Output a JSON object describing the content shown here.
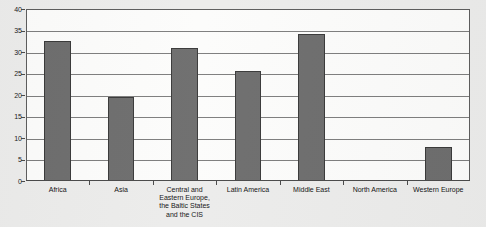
{
  "page": {
    "clipped_top_text": "· · ·",
    "background_color": "#ececeb"
  },
  "chart_data": {
    "type": "bar",
    "title": "",
    "xlabel": "",
    "ylabel": "",
    "categories": [
      "Africa",
      "Asia",
      "Central and Eastern Europe, the Baltic States and the CIS",
      "Latin America",
      "Middle East",
      "North America",
      "Western Europe"
    ],
    "values": [
      32.5,
      19.5,
      31.0,
      25.5,
      34.3,
      0,
      8.0
    ],
    "ylim": [
      0,
      40
    ],
    "yticks": [
      0,
      5,
      10,
      15,
      20,
      25,
      30,
      35,
      40
    ],
    "ytick_labels": [
      "0",
      "5",
      "10",
      "15",
      "20",
      "25",
      "30",
      "35",
      "40"
    ],
    "grid": true,
    "legend": false,
    "bar_color": "#6e6e6e",
    "bar_border_color": "#3a3a3a",
    "plot_background": "#fcfcfb",
    "axis_color": "#5d5d5d"
  }
}
